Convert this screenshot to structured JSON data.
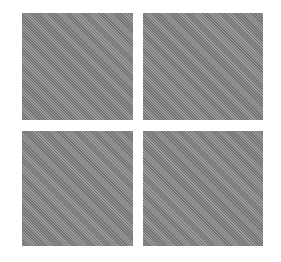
{
  "icon": {
    "name": "four-squares-grid",
    "color": "#8c8c8c",
    "background": "#ffffff",
    "tiles": [
      {
        "name": "top-left",
        "x": 22,
        "y": 13,
        "w": 111,
        "h": 107
      },
      {
        "name": "top-right",
        "x": 143,
        "y": 13,
        "w": 120,
        "h": 107
      },
      {
        "name": "bottom-left",
        "x": 22,
        "y": 131,
        "w": 111,
        "h": 115
      },
      {
        "name": "bottom-right",
        "x": 143,
        "y": 131,
        "w": 120,
        "h": 115
      }
    ]
  }
}
